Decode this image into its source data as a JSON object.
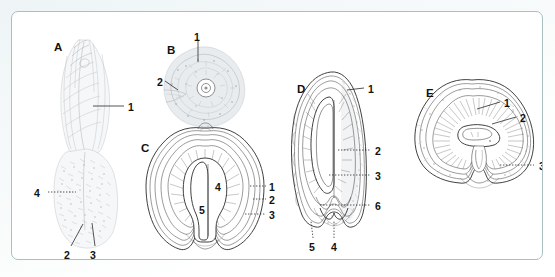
{
  "figure": {
    "background_color": "#f4f8f8",
    "frame_color": "#a9bfc0",
    "plate_background": "#ffffff",
    "ink_color": "#2b2b2b",
    "label_color": "#111111"
  },
  "panels": [
    {
      "id": "A",
      "letter": "A",
      "letter_x": 42,
      "letter_y": 30,
      "callouts": [
        {
          "num": "1",
          "x": 116,
          "y": 90
        },
        {
          "num": "4",
          "x": 22,
          "y": 176
        },
        {
          "num": "2",
          "x": 52,
          "y": 238
        },
        {
          "num": "3",
          "x": 78,
          "y": 238
        }
      ]
    },
    {
      "id": "B",
      "letter": "B",
      "letter_x": 155,
      "letter_y": 33,
      "callouts": [
        {
          "num": "1",
          "x": 182,
          "y": 20
        },
        {
          "num": "2",
          "x": 145,
          "y": 65
        }
      ]
    },
    {
      "id": "C",
      "letter": "C",
      "letter_x": 129,
      "letter_y": 131,
      "callouts": [
        {
          "num": "4",
          "x": 203,
          "y": 170
        },
        {
          "num": "5",
          "x": 187,
          "y": 193
        },
        {
          "num": "1",
          "x": 257,
          "y": 170
        },
        {
          "num": "2",
          "x": 257,
          "y": 183
        },
        {
          "num": "3",
          "x": 257,
          "y": 198
        }
      ]
    },
    {
      "id": "D",
      "letter": "D",
      "letter_x": 285,
      "letter_y": 72,
      "callouts": [
        {
          "num": "1",
          "x": 356,
          "y": 72
        },
        {
          "num": "2",
          "x": 363,
          "y": 134
        },
        {
          "num": "3",
          "x": 363,
          "y": 159
        },
        {
          "num": "6",
          "x": 363,
          "y": 189
        },
        {
          "num": "5",
          "x": 297,
          "y": 230
        },
        {
          "num": "4",
          "x": 319,
          "y": 230
        }
      ]
    },
    {
      "id": "E",
      "letter": "E",
      "letter_x": 414,
      "letter_y": 76,
      "callouts": [
        {
          "num": "1",
          "x": 492,
          "y": 86
        },
        {
          "num": "2",
          "x": 508,
          "y": 101
        },
        {
          "num": "3",
          "x": 527,
          "y": 149
        }
      ]
    }
  ]
}
